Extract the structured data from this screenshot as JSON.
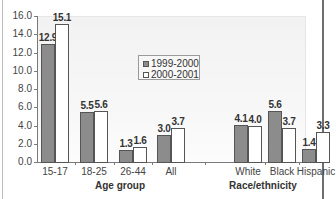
{
  "chart_data": {
    "type": "bar",
    "title": "",
    "xlabel": "",
    "ylabel": "",
    "ylim": [
      0,
      16
    ],
    "yticks": [
      "0.0",
      "2.0",
      "4.0",
      "6.0",
      "8.0",
      "10.0",
      "12.0",
      "14.0",
      "16.0"
    ],
    "grid": false,
    "legend_position": "inside-center-top",
    "groups": [
      {
        "title": "Age group",
        "categories": [
          "15-17",
          "18-25",
          "26-44",
          "All"
        ]
      },
      {
        "title": "Race/ethnicity",
        "categories": [
          "White",
          "Black",
          "Hispanic"
        ]
      }
    ],
    "categories": [
      "15-17",
      "18-25",
      "26-44",
      "All",
      "White",
      "Black",
      "Hispanic"
    ],
    "series": [
      {
        "name": "1999-2000",
        "color": "#8c8c8c",
        "values": [
          12.9,
          5.5,
          1.3,
          3.0,
          4.1,
          5.6,
          1.4
        ],
        "labels": [
          "12.9",
          "5.5",
          "1.3",
          "3.0",
          "4.1",
          "5.6",
          "1.4"
        ]
      },
      {
        "name": "2000-2001",
        "color": "#ffffff",
        "values": [
          15.1,
          5.6,
          1.6,
          3.7,
          4.0,
          3.7,
          3.3
        ],
        "labels": [
          "15.1",
          "5.6",
          "1.6",
          "3.7",
          "4.0",
          "3.7",
          "3.3"
        ]
      }
    ]
  }
}
